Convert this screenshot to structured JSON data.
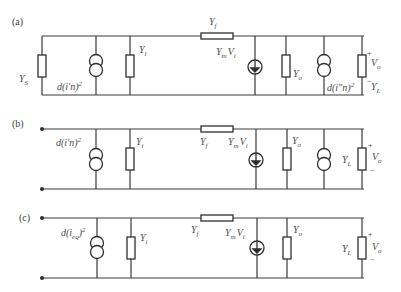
{
  "diagram": {
    "colors": {
      "line": "#3a3a3a",
      "text": "#4a4a4a",
      "background": "#ffffff"
    },
    "panels": [
      {
        "id": "a",
        "label": "(a)",
        "components": {
          "source_admittance": {
            "name": "Y",
            "sub": "S"
          },
          "noise_in": {
            "text": "d(i'n)",
            "sup": "2"
          },
          "input_admittance": {
            "name": "Y",
            "sub": "i"
          },
          "feedback_admittance": {
            "name": "Y",
            "sub": "f"
          },
          "vccs": {
            "name": "Y",
            "sub": "m",
            "tail": "V",
            "tail_sub": "i"
          },
          "output_admittance": {
            "name": "Y",
            "sub": "o"
          },
          "noise_out": {
            "text": "d(i\"n)",
            "sup": "2"
          },
          "load_admittance": {
            "name": "Y",
            "sub": "L"
          },
          "output_voltage": {
            "name": "V",
            "sub": "o",
            "plus": "+",
            "minus": "−"
          }
        }
      },
      {
        "id": "b",
        "label": "(b)",
        "components": {
          "noise_in": {
            "text": "d(i'n)",
            "sup": "2"
          },
          "input_admittance": {
            "name": "Y",
            "sub": "i"
          },
          "feedback_admittance": {
            "name": "Y",
            "sub": "f"
          },
          "vccs": {
            "name": "Y",
            "sub": "m",
            "tail": "V",
            "tail_sub": "i"
          },
          "output_admittance": {
            "name": "Y",
            "sub": "o"
          },
          "noise_out": {
            "text": "",
            "sup": ""
          },
          "load_admittance": {
            "name": "Y",
            "sub": "L"
          },
          "output_voltage": {
            "name": "V",
            "sub": "o",
            "plus": "+",
            "minus": "−"
          }
        }
      },
      {
        "id": "c",
        "label": "(c)",
        "components": {
          "noise_in": {
            "text": "d(i",
            "sub": "eq",
            "close": ")",
            "sup": "2"
          },
          "input_admittance": {
            "name": "Y",
            "sub": "i"
          },
          "feedback_admittance": {
            "name": "Y",
            "sub": "f"
          },
          "vccs": {
            "name": "Y",
            "sub": "m",
            "tail": "V",
            "tail_sub": "i"
          },
          "output_admittance": {
            "name": "Y",
            "sub": "o"
          },
          "load_admittance": {
            "name": "Y",
            "sub": "L"
          },
          "output_voltage": {
            "name": "V",
            "sub": "o",
            "plus": "+",
            "minus": "−"
          }
        }
      }
    ]
  }
}
